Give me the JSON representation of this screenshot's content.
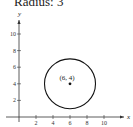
{
  "title": "Radius: 3",
  "chart_data": {
    "type": "scatter",
    "title": "Radius: 3",
    "xlabel": "x",
    "ylabel": "y",
    "xlim": [
      -1,
      12
    ],
    "ylim": [
      -1,
      12
    ],
    "x_ticks": [
      2,
      4,
      6,
      8,
      10
    ],
    "y_ticks": [
      2,
      4,
      6,
      8,
      10
    ],
    "grid": false,
    "shapes": [
      {
        "type": "circle",
        "center": [
          6,
          4
        ],
        "radius": 3
      }
    ],
    "points": [
      {
        "x": 6,
        "y": 4,
        "label": "(6, 4)"
      }
    ]
  }
}
